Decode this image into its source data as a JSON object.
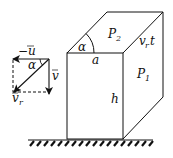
{
  "diagram": {
    "labels": {
      "neg_u": "−u",
      "alpha_vec": "α",
      "v": "v",
      "v_r": "v",
      "v_r_sub": "r",
      "P2": "P",
      "P2_sub": "2",
      "vrt_v": "v",
      "vrt_sub": "r",
      "vrt_t": "t",
      "alpha_box": "α",
      "a": "a",
      "P1": "P",
      "P1_sub": "1",
      "h": "h"
    },
    "colors": {
      "stroke": "#111111",
      "background": "#ffffff"
    }
  }
}
